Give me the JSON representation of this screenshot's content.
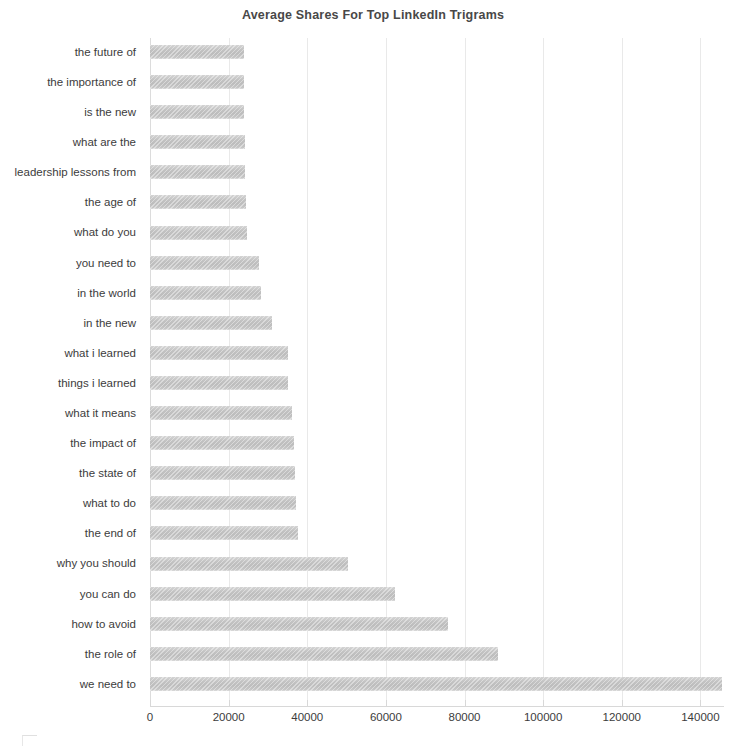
{
  "chart_data": {
    "type": "bar",
    "orientation": "horizontal",
    "title": "Average Shares For Top LinkedIn Trigrams",
    "xlabel": "",
    "ylabel": "",
    "xlim": [
      0,
      146000
    ],
    "xticks": [
      0,
      20000,
      40000,
      60000,
      80000,
      100000,
      120000,
      140000
    ],
    "xtick_labels": [
      "0",
      "20000",
      "40000",
      "60000",
      "80000",
      "100000",
      "120000",
      "140000"
    ],
    "grid": true,
    "grid_axis": "x",
    "legend": false,
    "bar_color": "#c2c2c2",
    "categories": [
      "the future of",
      "the importance of",
      "is the new",
      "what are the",
      "leadership lessons from",
      "the age of",
      "what do you",
      "you need to",
      "in the world",
      "in the new",
      "what i learned",
      "things i learned",
      "what it means",
      "the impact of",
      "the state of",
      "what to do",
      "the end of",
      "why you should",
      "you can do",
      "how to avoid",
      "the role of",
      "we need to"
    ],
    "values": [
      23800,
      23900,
      24000,
      24100,
      24200,
      24500,
      24700,
      27800,
      28200,
      31000,
      35000,
      35200,
      36200,
      36700,
      37000,
      37100,
      37600,
      50400,
      62300,
      75800,
      88500,
      145500
    ]
  },
  "colors": {
    "title": "#484848",
    "text": "#3c3c3c",
    "gridline": "#e9e9e9",
    "axis": "#d8d8d8",
    "bar_light": "#d4d4d4",
    "bar_dark": "#bdbdbd"
  }
}
